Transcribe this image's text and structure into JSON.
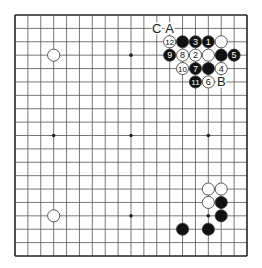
{
  "diagram": {
    "type": "go-board",
    "size": 19,
    "geometry": {
      "left": 15,
      "top": 15,
      "right": 247,
      "bottom": 256
    },
    "colors": {
      "line": "#555555",
      "border": "#222222",
      "black": "#111111",
      "white": "#ffffff",
      "stone_outline": "#333333",
      "label": "#222222",
      "background": "#ffffff"
    },
    "star_points": [
      [
        3,
        3
      ],
      [
        9,
        3
      ],
      [
        15,
        3
      ],
      [
        3,
        9
      ],
      [
        9,
        9
      ],
      [
        15,
        9
      ],
      [
        3,
        15
      ],
      [
        9,
        15
      ],
      [
        15,
        15
      ]
    ],
    "stones": [
      {
        "color": "white",
        "col": 3,
        "row": 3,
        "number": ""
      },
      {
        "color": "white",
        "col": 3,
        "row": 15,
        "number": ""
      },
      {
        "color": "white",
        "col": 12,
        "row": 2,
        "number": "12"
      },
      {
        "color": "black",
        "col": 13,
        "row": 2,
        "number": ""
      },
      {
        "color": "black",
        "col": 14,
        "row": 2,
        "number": "3"
      },
      {
        "color": "black",
        "col": 15,
        "row": 2,
        "number": "1"
      },
      {
        "color": "white",
        "col": 16,
        "row": 2,
        "number": ""
      },
      {
        "color": "black",
        "col": 12,
        "row": 3,
        "number": "9"
      },
      {
        "color": "white",
        "col": 13,
        "row": 3,
        "number": "8"
      },
      {
        "color": "white",
        "col": 14,
        "row": 3,
        "number": "2"
      },
      {
        "color": "white",
        "col": 15,
        "row": 3,
        "number": ""
      },
      {
        "color": "black",
        "col": 16,
        "row": 3,
        "number": ""
      },
      {
        "color": "black",
        "col": 17,
        "row": 3,
        "number": "5"
      },
      {
        "color": "white",
        "col": 13,
        "row": 4,
        "number": "10"
      },
      {
        "color": "black",
        "col": 14,
        "row": 4,
        "number": "7"
      },
      {
        "color": "black",
        "col": 15,
        "row": 4,
        "number": ""
      },
      {
        "color": "white",
        "col": 16,
        "row": 4,
        "number": "4"
      },
      {
        "color": "black",
        "col": 14,
        "row": 5,
        "number": "11"
      },
      {
        "color": "white",
        "col": 15,
        "row": 5,
        "number": "6"
      },
      {
        "color": "white",
        "col": 15,
        "row": 13,
        "number": ""
      },
      {
        "color": "white",
        "col": 16,
        "row": 13,
        "number": ""
      },
      {
        "color": "white",
        "col": 15,
        "row": 14,
        "number": ""
      },
      {
        "color": "black",
        "col": 16,
        "row": 14,
        "number": ""
      },
      {
        "color": "black",
        "col": 16,
        "row": 15,
        "number": ""
      },
      {
        "color": "black",
        "col": 13,
        "row": 16,
        "number": ""
      },
      {
        "color": "black",
        "col": 15,
        "row": 16,
        "number": ""
      }
    ],
    "labels": [
      {
        "text": "C",
        "col": 11,
        "row": 1
      },
      {
        "text": "A",
        "col": 12,
        "row": 1
      },
      {
        "text": "B",
        "col": 16,
        "row": 5
      }
    ]
  }
}
